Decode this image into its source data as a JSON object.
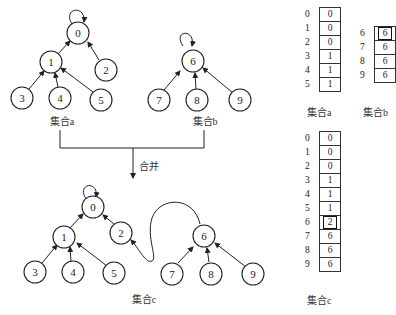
{
  "merge_label": "合并",
  "set_a": {
    "caption": "集合a",
    "nodes": [
      {
        "id": "0",
        "x": 78,
        "y": 33
      },
      {
        "id": "1",
        "x": 51,
        "y": 62
      },
      {
        "id": "2",
        "x": 106,
        "y": 70
      },
      {
        "id": "3",
        "x": 22,
        "y": 98
      },
      {
        "id": "4",
        "x": 60,
        "y": 98
      },
      {
        "id": "5",
        "x": 101,
        "y": 100
      }
    ],
    "table": {
      "caption": "集合a",
      "rows": [
        {
          "index": "0",
          "parent": "0"
        },
        {
          "index": "1",
          "parent": "0"
        },
        {
          "index": "2",
          "parent": "0"
        },
        {
          "index": "3",
          "parent": "1"
        },
        {
          "index": "4",
          "parent": "1"
        },
        {
          "index": "5",
          "parent": "1"
        }
      ]
    }
  },
  "set_b": {
    "caption": "集合b",
    "table": {
      "caption": "集合b",
      "rows": [
        {
          "index": "6",
          "parent": "6",
          "highlight": true
        },
        {
          "index": "7",
          "parent": "6"
        },
        {
          "index": "8",
          "parent": "6"
        },
        {
          "index": "9",
          "parent": "6"
        }
      ]
    }
  },
  "set_c": {
    "caption": "集合c",
    "table": {
      "caption": "集合c",
      "rows": [
        {
          "index": "0",
          "parent": "0"
        },
        {
          "index": "1",
          "parent": "0"
        },
        {
          "index": "2",
          "parent": "0"
        },
        {
          "index": "3",
          "parent": "1"
        },
        {
          "index": "4",
          "parent": "1"
        },
        {
          "index": "5",
          "parent": "1"
        },
        {
          "index": "6",
          "parent": "2",
          "highlight": true
        },
        {
          "index": "7",
          "parent": "6"
        },
        {
          "index": "8",
          "parent": "6"
        },
        {
          "index": "9",
          "parent": "6"
        }
      ]
    }
  },
  "labels": {
    "n0": "0",
    "n1": "1",
    "n2": "2",
    "n3": "3",
    "n4": "4",
    "n5": "5",
    "n6": "6",
    "n7": "7",
    "n8": "8",
    "n9": "9"
  }
}
